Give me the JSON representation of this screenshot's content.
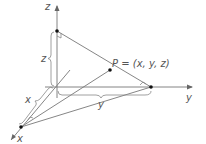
{
  "diagram": {
    "axes": {
      "z": {
        "label": "z"
      },
      "y": {
        "label": "y"
      },
      "x": {
        "label": "x"
      }
    },
    "point": {
      "label": "P = (x, y, z)"
    },
    "braces": {
      "z": "z",
      "x": "x",
      "y": "y"
    },
    "colors": {
      "line": "#777777",
      "dot": "#111111",
      "text": "#555555",
      "background": "#ffffff"
    }
  }
}
